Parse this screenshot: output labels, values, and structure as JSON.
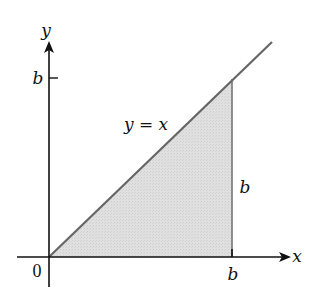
{
  "diagram": {
    "title": "",
    "axes": {
      "x_label": "x",
      "y_label": "y",
      "origin_label": "0"
    },
    "ticks": {
      "x_tick_label": "b",
      "y_tick_label": "b"
    },
    "curve_label": "y = x",
    "side_label": "b",
    "region": {
      "description": "Shaded triangle bounded by y = x, x-axis, and x = b",
      "vertices": [
        [
          0,
          0
        ],
        [
          "b",
          0
        ],
        [
          "b",
          "b"
        ]
      ]
    },
    "colors": {
      "axis": "#111111",
      "line": "#666666",
      "vertical": "#777777",
      "fill": "#dcdcdc"
    }
  }
}
